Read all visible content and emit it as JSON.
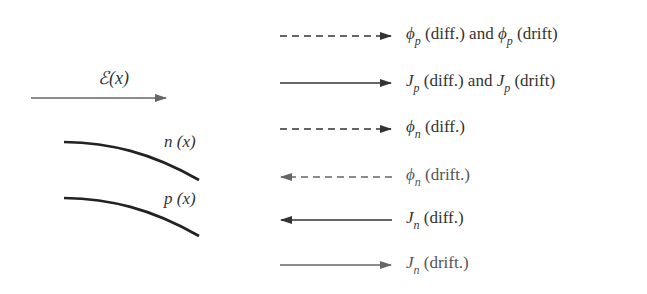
{
  "left": {
    "field_label": "ℰ(x)",
    "curves": [
      {
        "name": "n",
        "label": "n (x)"
      },
      {
        "name": "p",
        "label": "p (x)"
      }
    ]
  },
  "legend": [
    {
      "style": "dashed",
      "direction": "right",
      "sym": "ϕ",
      "sub": "p",
      "text": " (diff.) and ",
      "sym2": "ϕ",
      "sub2": "p",
      "text2": " (drift)"
    },
    {
      "style": "solid",
      "direction": "right",
      "sym": "J",
      "sub": "p",
      "text": " (diff.) and ",
      "sym2": "J",
      "sub2": "p",
      "text2": " (drift)"
    },
    {
      "style": "dashed",
      "direction": "right",
      "sym": "ϕ",
      "sub": "n",
      "text": " (diff.)"
    },
    {
      "style": "dashed",
      "direction": "left",
      "sym": "ϕ",
      "sub": "n",
      "text": " (drift.)"
    },
    {
      "style": "solid",
      "direction": "left",
      "sym": "J",
      "sub": "n",
      "text": " (diff.)"
    },
    {
      "style": "solid",
      "direction": "right",
      "sym": "J",
      "sub": "n",
      "text": " (drift.)"
    }
  ],
  "colors": {
    "line": "#333333",
    "light_line": "#666666"
  }
}
